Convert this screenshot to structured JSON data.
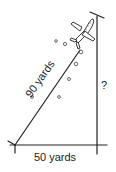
{
  "diagram": {
    "type": "right-triangle-word-problem",
    "hypotenuse_label": "90 yards",
    "base_label": "50 yards",
    "height_label": "?",
    "object": "airplane",
    "line_color": "#222222",
    "background": "#ffffff"
  }
}
